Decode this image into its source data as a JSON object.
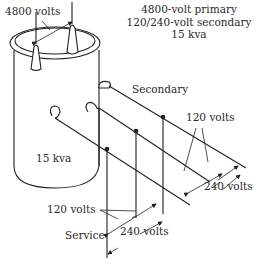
{
  "diagram": {
    "title_block": {
      "line1": "4800-volt primary",
      "line2": "120/240-volt secondary",
      "line3": "15 kva"
    },
    "labels": {
      "primary_voltage": "4800 volts",
      "transformer_rating": "15 kva",
      "secondary": "Secondary",
      "upper_120": "120 volts",
      "upper_240": "240 volts",
      "lower_120": "120 volts",
      "lower_240": "240 volts",
      "service": "Service"
    },
    "colors": {
      "line": "#222222",
      "background": "#ffffff"
    }
  }
}
